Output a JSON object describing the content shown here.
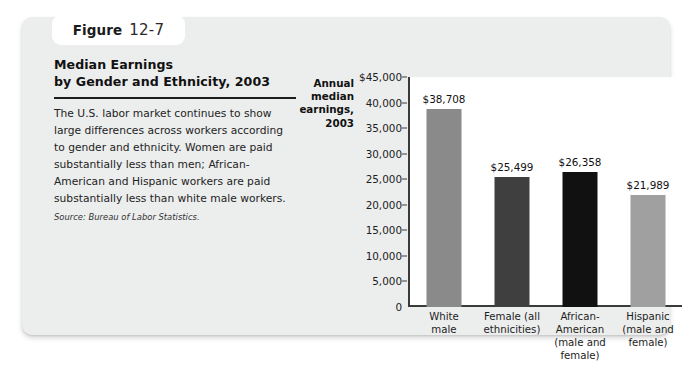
{
  "figure": {
    "tab_word": "Figure",
    "tab_number": "12-7",
    "title": "Median Earnings\nby Gender and Ethnicity, 2003",
    "body": "The U.S. labor market continues to show large differences across workers according to gender and ethnicity. Women are paid substantially less than men; African-American and Hispanic workers are paid substantially less than white male workers.",
    "source": "Source: Bureau of Labor Statistics."
  },
  "chart_data": {
    "type": "bar",
    "title": "Median Earnings by Gender and Ethnicity, 2003",
    "xlabel": "",
    "ylabel": "Annual\nmedian\nearnings,\n2003",
    "categories": [
      "White\nmale",
      "Female (all\nethnicities)",
      "African-\nAmerican\n(male and\nfemale)",
      "Hispanic\n(male and\nfemale)"
    ],
    "values": [
      38708,
      25499,
      26358,
      21989
    ],
    "value_labels": [
      "$38,708",
      "$25,499",
      "$26,358",
      "$21,989"
    ],
    "bar_colors": [
      "#8a8a8a",
      "#3f3f3f",
      "#111111",
      "#a0a0a0"
    ],
    "ylim": [
      0,
      45000
    ],
    "ytick_values": [
      45000,
      40000,
      35000,
      30000,
      25000,
      20000,
      15000,
      10000,
      5000,
      0
    ],
    "ytick_labels": [
      "$45,000",
      "40,000",
      "35,000",
      "30,000",
      "25,000",
      "20,000",
      "15,000",
      "10,000",
      "5,000",
      "0"
    ],
    "grid": false,
    "legend": "none"
  },
  "colors": {
    "card_background": "#eceded",
    "plot_background": "#ffffff",
    "axis": "#3a3a3a",
    "text": "#1d1d1d"
  }
}
